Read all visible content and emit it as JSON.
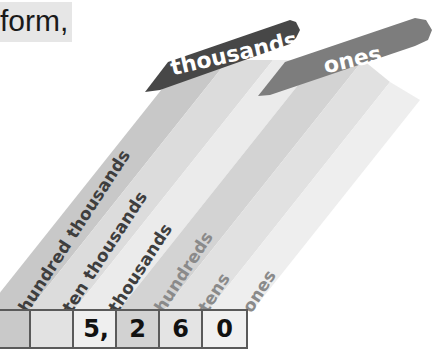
{
  "intro_text": "form,",
  "place_value_chart": {
    "periods": [
      {
        "label": "thousands",
        "color": "#474747"
      },
      {
        "label": "ones",
        "color": "#7d7d7d"
      }
    ],
    "columns": [
      {
        "label": "hundred thousands",
        "period": "thousands",
        "digit": "",
        "cell_color": "#c9c9c9",
        "stripe_color": "#c8c8c8"
      },
      {
        "label": "ten thousands",
        "period": "thousands",
        "digit": "",
        "cell_color": "#e2e2e2",
        "stripe_color": "#dcdcdc"
      },
      {
        "label": "thousands",
        "period": "thousands",
        "digit": "5,",
        "cell_color": "#efefef",
        "stripe_color": "#ebebeb"
      },
      {
        "label": "hundreds",
        "period": "ones",
        "digit": "2",
        "cell_color": "#d2d2d2",
        "stripe_color": "#d3d3d3"
      },
      {
        "label": "tens",
        "period": "ones",
        "digit": "6",
        "cell_color": "#e4e4e4",
        "stripe_color": "#e1e1e1"
      },
      {
        "label": "ones",
        "period": "ones",
        "digit": "0",
        "cell_color": "#f0f0f0",
        "stripe_color": "#eeeeee"
      }
    ],
    "number": "5,260"
  }
}
